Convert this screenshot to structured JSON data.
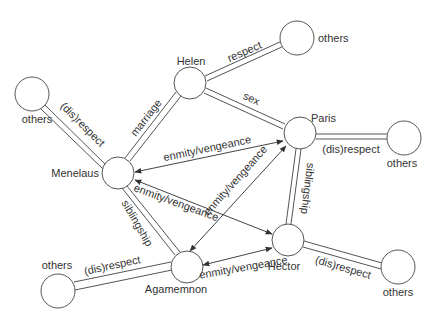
{
  "diagram": {
    "type": "relationship-graph",
    "nodes": {
      "menelaus": {
        "label": "Menelaus",
        "cx": 118,
        "cy": 173
      },
      "helen": {
        "label": "Helen",
        "cx": 190,
        "cy": 83
      },
      "paris": {
        "label": "Paris",
        "cx": 300,
        "cy": 133
      },
      "hector": {
        "label": "Hector",
        "cx": 288,
        "cy": 240
      },
      "agamemnon": {
        "label": "Agamemnon",
        "cx": 187,
        "cy": 267
      },
      "others_tl": {
        "label": "others",
        "cx": 32,
        "cy": 94
      },
      "others_tr": {
        "label": "others",
        "cx": 297,
        "cy": 38
      },
      "others_r": {
        "label": "others",
        "cx": 404,
        "cy": 138
      },
      "others_br": {
        "label": "others",
        "cx": 398,
        "cy": 267
      },
      "others_bl": {
        "label": "others",
        "cx": 58,
        "cy": 291
      }
    },
    "edges": {
      "menelaus_others": {
        "label": "(dis)respect",
        "style": "double"
      },
      "menelaus_helen": {
        "label": "marriage",
        "style": "double"
      },
      "helen_others": {
        "label": "respect",
        "style": "double"
      },
      "helen_paris": {
        "label": "sex",
        "style": "double"
      },
      "paris_others": {
        "label": "(dis)respect",
        "style": "double"
      },
      "paris_hector": {
        "label": "siblingship",
        "style": "double"
      },
      "menelaus_agamemnon": {
        "label": "siblingship",
        "style": "double"
      },
      "agamemnon_others": {
        "label": "(dis)respect",
        "style": "double"
      },
      "hector_others": {
        "label": "(dis)respect",
        "style": "double"
      },
      "menelaus_paris": {
        "label": "enmity/vengeance",
        "style": "bidirectional-arrow"
      },
      "menelaus_hector": {
        "label": "enmity/vengeance",
        "style": "bidirectional-arrow"
      },
      "agamemnon_paris": {
        "label": "enmity/vengeance",
        "style": "bidirectional-arrow"
      },
      "agamemnon_hector": {
        "label": "enmity/vengeance",
        "style": "bidirectional-arrow"
      }
    }
  },
  "colors": {
    "stroke": "#555555",
    "text": "#333333",
    "background": "#ffffff"
  }
}
